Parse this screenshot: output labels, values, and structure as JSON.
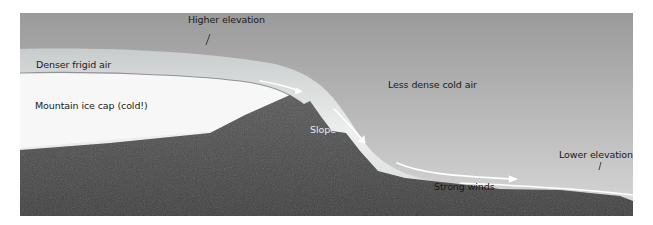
{
  "diagram": {
    "type": "cross-section illustration",
    "labels": {
      "higher_elevation": "Higher elevation",
      "denser_frigid_air": "Denser frigid air",
      "mountain_ice_cap": "Mountain ice cap (cold!)",
      "less_dense_cold_air": "Less dense cold air",
      "slope": "Slope",
      "strong_winds": "Strong winds",
      "lower_elevation": "Lower elevation"
    },
    "colors": {
      "sky_top": "#9c9c9c",
      "sky_bottom": "#d6d6d6",
      "air_flow": "#e4e6e6",
      "ice_cap": "#f7f7f7",
      "rock": "#4a4a4a",
      "arrow": "#ffffff"
    }
  }
}
